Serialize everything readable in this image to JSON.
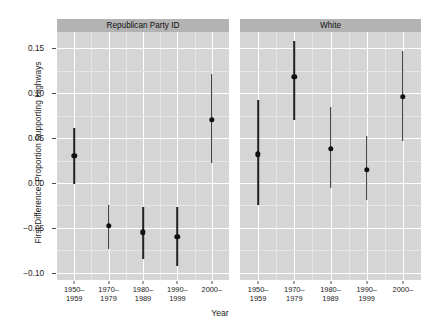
{
  "chart_data": {
    "type": "scatter",
    "title": "",
    "xlabel": "Year",
    "ylabel": "First Difference, Proportion Supporting Highways",
    "ylim": [
      -0.108,
      0.168
    ],
    "yticks": [
      0.15,
      0.1,
      0.05,
      0.0,
      -0.05,
      -0.1
    ],
    "ytick_labels": [
      "0.15",
      "0.10",
      "0.05",
      "0.00",
      "-0.05",
      "-0.10"
    ],
    "grid": true,
    "legend": "none",
    "categories": [
      "1950-\n1959",
      "1970-\n1979",
      "1980-\n1989",
      "1990-\n1999",
      "2000-"
    ],
    "panels": [
      {
        "label": "Republican Party ID",
        "points": [
          {
            "x": "1950-\n1959",
            "estimate": 0.03,
            "low": -0.001,
            "high": 0.061
          },
          {
            "x": "1970-\n1979",
            "estimate": -0.048,
            "low": -0.074,
            "high": -0.025
          },
          {
            "x": "1980-\n1989",
            "estimate": -0.055,
            "low": -0.085,
            "high": -0.027
          },
          {
            "x": "1990-\n1999",
            "estimate": -0.06,
            "low": -0.092,
            "high": -0.027
          },
          {
            "x": "2000-",
            "estimate": 0.07,
            "low": 0.022,
            "high": 0.121
          }
        ]
      },
      {
        "label": "White",
        "points": [
          {
            "x": "1950-\n1959",
            "estimate": 0.032,
            "low": -0.025,
            "high": 0.092
          },
          {
            "x": "1970-\n1979",
            "estimate": 0.118,
            "low": 0.07,
            "high": 0.158
          },
          {
            "x": "1980-\n1989",
            "estimate": 0.038,
            "low": -0.006,
            "high": 0.085
          },
          {
            "x": "1990-\n1999",
            "estimate": 0.015,
            "low": -0.019,
            "high": 0.052
          },
          {
            "x": "2000-",
            "estimate": 0.096,
            "low": 0.047,
            "high": 0.147
          }
        ]
      }
    ],
    "colors": {
      "panel_background": "#d5d5d5",
      "strip_background": "#b3b3b3",
      "gridline_major": "#ffffff",
      "gridline_minor": "#e6e6e6",
      "point": "#111111",
      "interval": "#222222",
      "text": "#1a1a1a",
      "page_background": "#ffffff"
    }
  },
  "xtick_lines": [
    [
      "1950–",
      "1959"
    ],
    [
      "1970–",
      "1979"
    ],
    [
      "1980–",
      "1989"
    ],
    [
      "1990–",
      "1999"
    ],
    [
      "2000–",
      ""
    ]
  ]
}
